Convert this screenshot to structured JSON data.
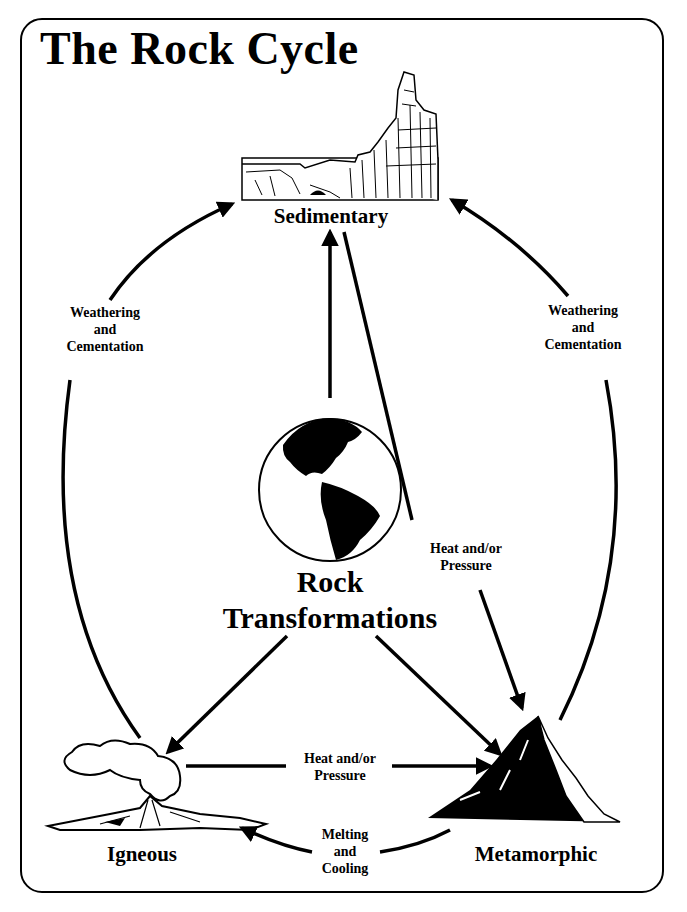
{
  "title": "The Rock Cycle",
  "nodes": {
    "sedimentary": "Sedimentary",
    "igneous": "Igneous",
    "metamorphic": "Metamorphic",
    "center_line1": "Rock",
    "center_line2": "Transformations"
  },
  "edges": {
    "left_weathering": {
      "line1": "Weathering",
      "line2": "and",
      "line3": "Cementation"
    },
    "right_weathering": {
      "line1": "Weathering",
      "line2": "and",
      "line3": "Cementation"
    },
    "sed_to_meta": {
      "line1": "Heat and/or",
      "line2": "Pressure"
    },
    "ign_to_meta": {
      "line1": "Heat and/or",
      "line2": "Pressure"
    },
    "meta_to_ign": {
      "line1": "Melting",
      "line2": "and",
      "line3": "Cooling"
    }
  },
  "icons": {
    "sedimentary": "canyon-cliffs-illustration",
    "igneous": "erupting-volcano-illustration",
    "metamorphic": "mountain-peak-illustration",
    "center": "earth-globe-americas"
  }
}
